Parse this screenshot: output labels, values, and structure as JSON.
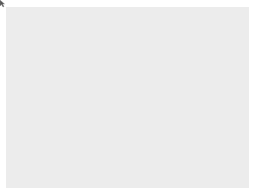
{
  "canvas": {
    "background": "#ececec",
    "frame_color": "#ffffff"
  },
  "path": {
    "stroke_color": "#3a3a3a",
    "stroke_width": 1,
    "vertex_color": "#2a2a2a",
    "top_vertices": [
      [
        46,
        25
      ],
      [
        58,
        26
      ],
      [
        75,
        26
      ],
      [
        87,
        25
      ],
      [
        103,
        24
      ],
      [
        115,
        24
      ],
      [
        128,
        24
      ],
      [
        143,
        24
      ],
      [
        159,
        24
      ]
    ],
    "right_curve": [
      [
        159,
        24
      ],
      [
        164,
        50
      ],
      [
        168,
        90
      ],
      [
        170,
        130
      ],
      [
        170,
        158
      ]
    ],
    "bottom_vertices": [
      [
        170,
        158
      ],
      [
        158,
        158
      ],
      [
        143,
        158
      ],
      [
        128,
        158
      ],
      [
        114,
        157
      ],
      [
        99,
        157
      ],
      [
        88,
        157
      ],
      [
        80,
        157
      ],
      [
        73,
        157
      ]
    ]
  },
  "cursor": {
    "icon": "cursor-pointer-icon",
    "x": 124,
    "y": 104
  }
}
